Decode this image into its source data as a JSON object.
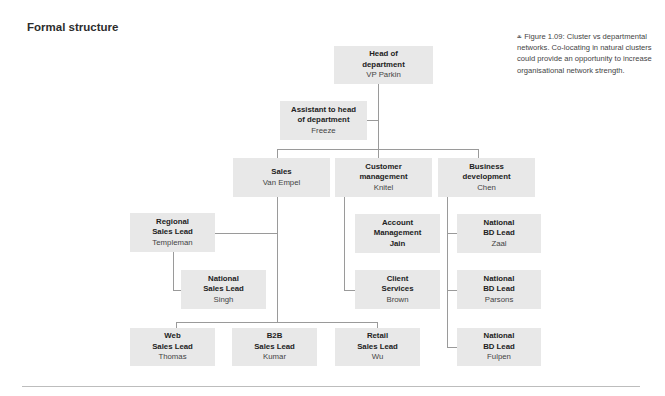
{
  "title": "Formal structure",
  "caption": {
    "icon": "figure-marker-icon",
    "text": "Figure 1.09: Cluster vs departmental networks. Co-locating in natural clusters could provide an opportunity to increase organisational network strength."
  },
  "colors": {
    "box_fill": "#e8e8e8",
    "connector": "#9a9a9a",
    "text": "#2b2b2b"
  },
  "nodes": {
    "head": {
      "role": "Head of department",
      "role_l1": "Head of",
      "role_l2": "department",
      "person": "VP Parkin"
    },
    "assistant": {
      "role": "Assistant to head of department",
      "role_l1": "Assistant to head",
      "role_l2": "of department",
      "person": "Freeze"
    },
    "sales": {
      "role": "Sales",
      "role_l1": "Sales",
      "person": "Van Empel"
    },
    "customer": {
      "role": "Customer management",
      "role_l1": "Customer",
      "role_l2": "management",
      "person": "Knitel"
    },
    "business": {
      "role": "Business development",
      "role_l1": "Business",
      "role_l2": "development",
      "person": "Chen"
    },
    "regional": {
      "role": "Regional Sales Lead",
      "role_l1": "Regional",
      "role_l2": "Sales Lead",
      "person": "Templeman"
    },
    "national_sales": {
      "role": "National Sales Lead",
      "role_l1": "National",
      "role_l2": "Sales Lead",
      "person": "Singh"
    },
    "web": {
      "role": "Web Sales Lead",
      "role_l1": "Web",
      "role_l2": "Sales Lead",
      "person": "Thomas"
    },
    "b2b": {
      "role": "B2B Sales Lead",
      "role_l1": "B2B",
      "role_l2": "Sales Lead",
      "person": "Kumar"
    },
    "retail": {
      "role": "Retail Sales Lead",
      "role_l1": "Retail",
      "role_l2": "Sales Lead",
      "person": "Wu"
    },
    "account": {
      "role": "Account Management",
      "role_l1": "Account",
      "role_l2": "Management",
      "person": "Jain"
    },
    "client": {
      "role": "Client Services",
      "role_l1": "Client",
      "role_l2": "Services",
      "person": "Brown"
    },
    "bd1": {
      "role": "National BD Lead",
      "role_l1": "National",
      "role_l2": "BD Lead",
      "person": "Zaal"
    },
    "bd2": {
      "role": "National BD Lead",
      "role_l1": "National",
      "role_l2": "BD Lead",
      "person": "Parsons"
    },
    "bd3": {
      "role": "National BD Lead",
      "role_l1": "National",
      "role_l2": "BD Lead",
      "person": "Fulpen"
    }
  }
}
